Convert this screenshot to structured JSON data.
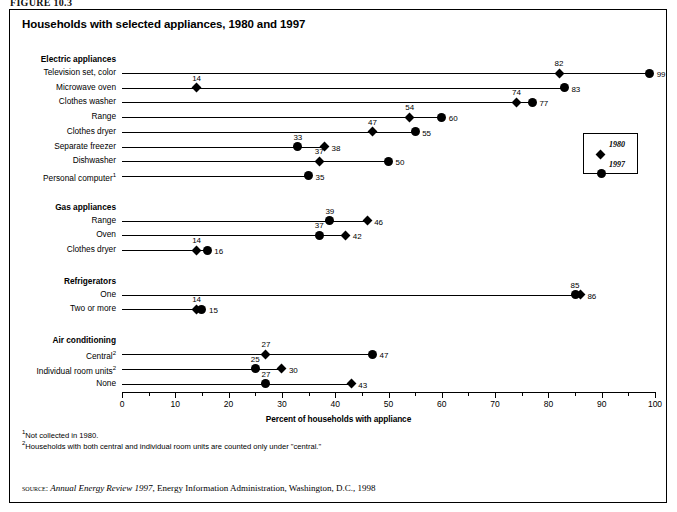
{
  "figure_label": "FIGURE 10.3",
  "title": "Households with selected appliances, 1980 and 1997",
  "legend": {
    "items": [
      {
        "marker": "diamond-marker",
        "label": "1980"
      },
      {
        "marker": "circle-marker",
        "label": "1997"
      }
    ]
  },
  "axis": {
    "title": "Percent of households with appliance",
    "ticks": [
      "0",
      "10",
      "20",
      "30",
      "40",
      "50",
      "60",
      "70",
      "80",
      "90",
      "100"
    ]
  },
  "footnotes": [
    {
      "marker": "1",
      "text": "Not collected in 1980."
    },
    {
      "marker": "2",
      "text": "Households with both central and individual room units are counted only under \"central.\""
    }
  ],
  "source": {
    "prefix": "source:",
    "italic": "Annual Energy Review 1997",
    "rest": ", Energy Information Administration, Washington, D.C., 1998"
  },
  "chart_data": {
    "type": "scatter",
    "title": "Households with selected appliances, 1980 and 1997",
    "xlabel": "Percent of households with appliance",
    "ylabel": "",
    "xlim": [
      0,
      100
    ],
    "xticks": [
      0,
      10,
      20,
      30,
      40,
      50,
      60,
      70,
      80,
      90,
      100
    ],
    "grid": false,
    "legend_position": "right-upper",
    "series": [
      {
        "name": "1980",
        "marker": "diamond"
      },
      {
        "name": "1997",
        "marker": "circle"
      }
    ],
    "groups": [
      {
        "group": "Electric appliances",
        "rows": [
          {
            "label": "Television set, color",
            "v1980": 82,
            "v1997": 99
          },
          {
            "label": "Microwave oven",
            "v1980": 14,
            "v1997": 83
          },
          {
            "label": "Clothes washer",
            "v1980": 74,
            "v1997": 77
          },
          {
            "label": "Range",
            "v1980": 54,
            "v1997": 60
          },
          {
            "label": "Clothes dryer",
            "v1980": 47,
            "v1997": 55
          },
          {
            "label": "Separate freezer",
            "v1980": 38,
            "v1997": 33
          },
          {
            "label": "Dishwasher",
            "v1980": 37,
            "v1997": 50
          },
          {
            "label": "Personal computer",
            "footnote": "1",
            "v1980": null,
            "v1997": 35
          }
        ]
      },
      {
        "group": "Gas appliances",
        "rows": [
          {
            "label": "Range",
            "v1980": 46,
            "v1997": 39
          },
          {
            "label": "Oven",
            "v1980": 42,
            "v1997": 37
          },
          {
            "label": "Clothes dryer",
            "v1980": 14,
            "v1997": 16
          }
        ]
      },
      {
        "group": "Refrigerators",
        "rows": [
          {
            "label": "One",
            "v1980": 86,
            "v1997": 85
          },
          {
            "label": "Two or more",
            "v1980": 14,
            "v1997": 15
          }
        ]
      },
      {
        "group": "Air conditioning",
        "rows": [
          {
            "label": "Central",
            "footnote": "2",
            "v1980": 27,
            "v1997": 47
          },
          {
            "label": "Individual room units",
            "footnote": "2",
            "v1980": 30,
            "v1997": 25
          },
          {
            "label": "None",
            "v1980": 43,
            "v1997": 27
          }
        ]
      }
    ]
  }
}
